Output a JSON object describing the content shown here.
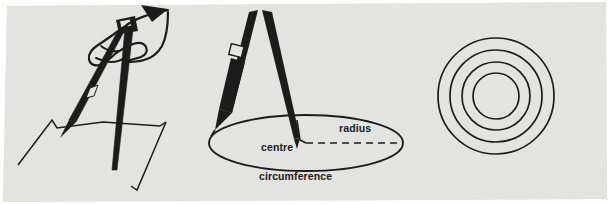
{
  "image": {
    "kind": "scanned-textbook-figure",
    "title": "Drawing a circle with a pair of compasses",
    "width": 609,
    "height": 204,
    "paper_color": "#e3e4e2",
    "page_background": "#ffffff",
    "ink_color": "#1c1c1c",
    "sheet_rotation_deg": -0.8
  },
  "panels": [
    {
      "id": "panel-hand-compass",
      "name": "hand-holding-compass",
      "caption": ""
    },
    {
      "id": "panel-compass-circle",
      "name": "compass-drawing-circle",
      "caption": ""
    },
    {
      "id": "panel-concentric-circles",
      "name": "concentric-circles",
      "caption": ""
    }
  ],
  "labels": {
    "centre": "centre",
    "radius": "radius",
    "circumference": "circumference"
  },
  "diagram": {
    "ellipse": {
      "cx": 306,
      "cy": 143,
      "rx": 97,
      "ry": 28
    },
    "radius_line": {
      "style": "dashed",
      "from_x": 306,
      "from_y": 143,
      "to_x": 403,
      "to_y": 143
    },
    "centre_mark": {
      "x": 306,
      "y": 143
    }
  },
  "concentric": {
    "cx": 496,
    "cy": 96,
    "radii": [
      23,
      34,
      46,
      58
    ],
    "count": 4,
    "stroke_width": 1.7
  }
}
